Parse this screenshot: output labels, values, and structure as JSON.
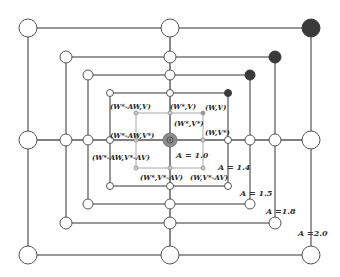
{
  "diagram": {
    "type": "nested-squares-state-lattice",
    "center": {
      "x": 170,
      "y": 140
    },
    "colors": {
      "outer_line": "#555555",
      "inner_line": "#aaaaaa",
      "node_fill": "#ffffff",
      "node_stroke": "#555555",
      "dark_node": "#3a3a3a",
      "center_node": "#8c8c8c"
    },
    "squares": [
      {
        "A": "A = 1.0",
        "label": "A  = 1.0",
        "x1": 136,
        "y1": 113,
        "x2": 203,
        "y2": 168,
        "node_r": 2,
        "style": "inner",
        "label_x": 176,
        "label_y": 158
      },
      {
        "A": "A = 1.4",
        "label": "A  = 1.4",
        "x1": 110,
        "y1": 93,
        "x2": 228,
        "y2": 186,
        "node_r": 3.5,
        "style": "outer",
        "label_x": 218,
        "label_y": 170
      },
      {
        "A": "A = 1.5",
        "label": "A  = 1.5",
        "x1": 88,
        "y1": 75,
        "x2": 250,
        "y2": 204,
        "node_r": 5,
        "style": "outer",
        "label_x": 240,
        "label_y": 196
      },
      {
        "A": "A = 1.8",
        "label": "A  =1.8",
        "x1": 66,
        "y1": 57,
        "x2": 275,
        "y2": 223,
        "node_r": 6,
        "style": "outer",
        "label_x": 266,
        "label_y": 214
      },
      {
        "A": "A = 2.0",
        "label": "A  =2.0",
        "x1": 28,
        "y1": 28,
        "x2": 311,
        "y2": 255,
        "node_r": 9,
        "style": "outer",
        "label_x": 298,
        "label_y": 236
      }
    ],
    "state_labels": [
      {
        "text": "(W*-AW,V)",
        "x": 110,
        "y": 109
      },
      {
        "text": "(W*,V)",
        "x": 170,
        "y": 109
      },
      {
        "text": "(W,V)",
        "x": 205,
        "y": 110
      },
      {
        "text": "(W*,V*)",
        "x": 174,
        "y": 126
      },
      {
        "text": "(W,V*)",
        "x": 205,
        "y": 135
      },
      {
        "text": "(W*-AW,V*)",
        "x": 110,
        "y": 138
      },
      {
        "text": "(W*-AW,V*-AV)",
        "x": 92,
        "y": 160
      },
      {
        "text": "(W*,V*-AV)",
        "x": 140,
        "y": 180
      },
      {
        "text": "(W,V*-AV)",
        "x": 190,
        "y": 180
      }
    ]
  }
}
